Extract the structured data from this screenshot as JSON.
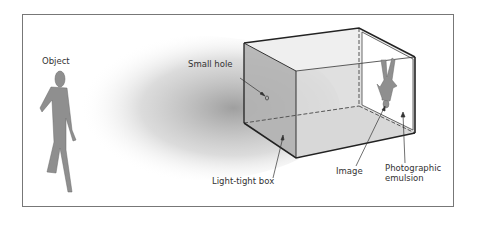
{
  "diagram": {
    "labels": {
      "object": "Object",
      "small_hole": "Small hole",
      "light_tight_box": "Light-tight box",
      "image": "Image",
      "photographic_emulsion_line1": "Photographic",
      "photographic_emulsion_line2": "emulsion"
    },
    "colors": {
      "figure_fill": "#8f8f8f",
      "box_side": "#b8b8b8",
      "box_front": "#dcdcdc",
      "box_top": "#f0f0f0",
      "light_cone": "#a0a0a0",
      "outline": "#222222",
      "frame": "#777777"
    }
  }
}
